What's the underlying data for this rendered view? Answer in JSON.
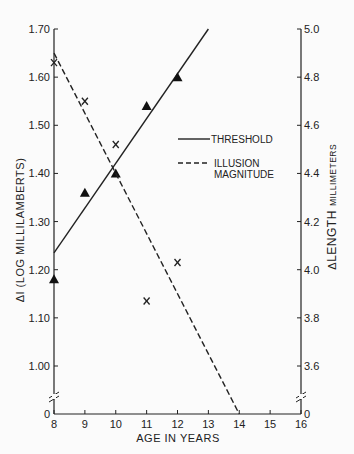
{
  "chart_data": {
    "type": "line",
    "title": "",
    "xlabel": "AGE IN YEARS",
    "ylabel_left": "ΔI (LOG MILLILAMBERTS)",
    "ylabel_right": "Δ LENGTH MILLIMETERS",
    "xlim": [
      8,
      16
    ],
    "ylim_left": [
      1.0,
      1.7
    ],
    "ylim_right": [
      3.6,
      5.0
    ],
    "x_ticks": [
      "8",
      "9",
      "10",
      "11",
      "12",
      "13",
      "14",
      "15",
      "16"
    ],
    "y_left_ticks": [
      "1.70",
      "1.60",
      "1.50",
      "1.40",
      "1.30",
      "1.20",
      "1.10",
      "1.00",
      "0"
    ],
    "y_right_ticks": [
      "5.0",
      "4.8",
      "4.6",
      "4.4",
      "4.2",
      "4.0",
      "3.8",
      "3.6",
      "0"
    ],
    "axis_break": true,
    "grid": false,
    "legend_position": "right-center",
    "series": [
      {
        "name": "THRESHOLD",
        "axis": "left",
        "marker": "triangle",
        "line_style": "solid",
        "points": [
          {
            "x": 8,
            "y": 1.18
          },
          {
            "x": 9,
            "y": 1.36
          },
          {
            "x": 10,
            "y": 1.4
          },
          {
            "x": 11,
            "y": 1.54
          },
          {
            "x": 12,
            "y": 1.6
          }
        ],
        "fit_line": [
          {
            "x": 8,
            "y": 1.235
          },
          {
            "x": 13,
            "y": 1.7
          }
        ]
      },
      {
        "name": "ILLUSION MAGNITUDE",
        "axis": "right",
        "marker": "x",
        "line_style": "dashed",
        "points": [
          {
            "x": 8,
            "y": 4.86
          },
          {
            "x": 9,
            "y": 4.7
          },
          {
            "x": 10,
            "y": 4.52
          },
          {
            "x": 11,
            "y": 3.87
          },
          {
            "x": 12,
            "y": 4.03
          }
        ],
        "fit_line": [
          {
            "x": 8,
            "y": 4.9
          },
          {
            "x": 14,
            "y": 0
          }
        ]
      }
    ]
  },
  "legend": {
    "threshold": "THRESHOLD",
    "illusion_line1": "ILLUSION",
    "illusion_line2": "MAGNITUDE"
  },
  "axes": {
    "xlabel": "AGE IN YEARS",
    "ylabel_left": "ΔI (LOG MILLILAMBERTS)",
    "ylabel_right_delta": "Δ",
    "ylabel_right_length": "LENGTH",
    "ylabel_right_unit": "MILLIMETERS"
  }
}
